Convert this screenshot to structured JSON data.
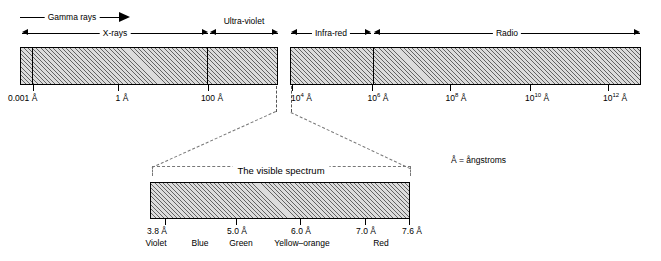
{
  "figure": {
    "note": "Å = ångstroms",
    "visible_title": "The visible spectrum"
  },
  "top_bands": [
    {
      "label": "Gamma rays",
      "arrows": "right"
    },
    {
      "label": "X-rays",
      "arrows": "both"
    },
    {
      "label": "Ultra-violet",
      "arrows": "both"
    },
    {
      "label": "Infra-red",
      "arrows": "both"
    },
    {
      "label": "Radio",
      "arrows": "both"
    }
  ],
  "left_bar": {
    "ticks": [
      {
        "label": "0.001 Å"
      },
      {
        "label": "1 Å"
      },
      {
        "label": "100 Å"
      }
    ]
  },
  "right_bar": {
    "ticks": [
      {
        "base": "10",
        "exp": "4",
        "unit": " Å"
      },
      {
        "base": "10",
        "exp": "6",
        "unit": " Å"
      },
      {
        "base": "10",
        "exp": "8",
        "unit": " Å"
      },
      {
        "base": "10",
        "exp": "10",
        "unit": " Å"
      },
      {
        "base": "10",
        "exp": "12",
        "unit": " Å"
      }
    ]
  },
  "visible_spectrum": {
    "ticks": [
      {
        "label": "3.8 Å"
      },
      {
        "label": "5.0 Å"
      },
      {
        "label": "6.0 Å"
      },
      {
        "label": "7.0 Å"
      },
      {
        "label": "7.6 Å"
      }
    ],
    "colors": [
      {
        "label": "Violet"
      },
      {
        "label": "Blue"
      },
      {
        "label": "Green"
      },
      {
        "label": "Yellow–orange"
      },
      {
        "label": "Red"
      }
    ]
  }
}
